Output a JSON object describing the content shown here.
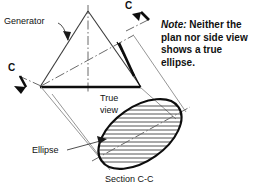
{
  "figure": {
    "labels": {
      "generator": "Generator",
      "cut_mark_top": "C",
      "cut_mark_left": "C",
      "true_view_line1": "True",
      "true_view_line2": "view",
      "ellipse": "Ellipse",
      "section": "Section C-C"
    },
    "note": {
      "lead": "Note:",
      "body": " Neither the plan nor side view shows a true ellipse."
    },
    "colors": {
      "line": "#111111",
      "thin_line": "#555555",
      "hatch": "#222222",
      "center_line": "#666666",
      "background": "#ffffff"
    },
    "geometry": {
      "cone_apex": [
        88,
        11
      ],
      "cone_base_left": [
        40,
        87
      ],
      "cone_base_right": [
        141,
        87
      ],
      "cut_trace_start": [
        41,
        86
      ],
      "cut_trace_end": [
        134,
        35
      ],
      "ellipse_center": [
        140,
        134
      ],
      "ellipse_major_radius": 47,
      "ellipse_minor_radius": 27,
      "ellipse_rotation_deg": -35,
      "hatch_count": 15
    }
  }
}
